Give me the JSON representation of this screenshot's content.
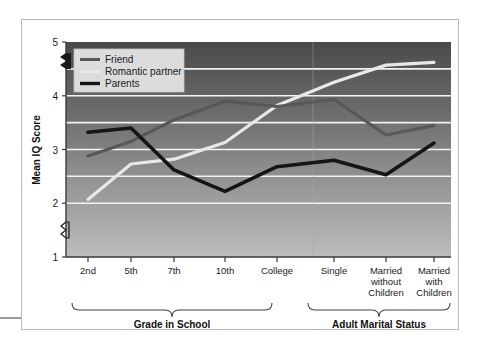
{
  "chart_data": {
    "type": "line",
    "title": "",
    "xlabel": "",
    "ylabel": "Mean IQ Score",
    "ylim": [
      1,
      5
    ],
    "yticks": [
      1,
      2,
      3,
      4,
      5
    ],
    "ytick_labels": [
      "1",
      "2",
      "3",
      "4",
      "5"
    ],
    "y_axis_break": true,
    "y_axis_break_between": [
      1,
      2
    ],
    "grid": true,
    "grid_lines_at": [
      2,
      2.5,
      3,
      3.5,
      4,
      4.5
    ],
    "legend_position": "top-left",
    "categories": [
      "2nd",
      "5th",
      "7th",
      "10th",
      "College",
      "Single",
      "Married without Children",
      "Married with Children"
    ],
    "series": [
      {
        "name": "Friend",
        "color": "#585858",
        "values": [
          2.88,
          3.15,
          3.55,
          3.9,
          3.8,
          3.93,
          3.27,
          3.45
        ]
      },
      {
        "name": "Romantic partner",
        "color": "#e8e8e8",
        "values": [
          2.07,
          2.73,
          2.82,
          3.13,
          3.82,
          4.25,
          4.57,
          4.62
        ]
      },
      {
        "name": "Parents",
        "color": "#151515",
        "values": [
          3.32,
          3.4,
          2.62,
          2.22,
          2.68,
          2.8,
          2.53,
          3.12
        ]
      }
    ],
    "group_brackets": [
      {
        "label": "Grade in School",
        "categories": [
          "2nd",
          "5th",
          "7th",
          "10th",
          "College"
        ]
      },
      {
        "label": "Adult Marital Status",
        "categories": [
          "Single",
          "Married without Children",
          "Married with Children"
        ]
      }
    ],
    "plot_background": {
      "gradient_from": "#4a4a4a",
      "gradient_to": "#b8b8b8",
      "gridline_color": "#f2f2f2"
    }
  },
  "legend": {
    "entries": [
      {
        "label": "Friend"
      },
      {
        "label": "Romantic partner"
      },
      {
        "label": "Parents"
      }
    ]
  },
  "axis": {
    "y_title": "Mean IQ Score",
    "y_labels": [
      "5",
      "4",
      "3",
      "2",
      "1"
    ]
  },
  "x_labels": [
    {
      "line1": "2nd",
      "line2": "",
      "line3": ""
    },
    {
      "line1": "5th",
      "line2": "",
      "line3": ""
    },
    {
      "line1": "7th",
      "line2": "",
      "line3": ""
    },
    {
      "line1": "10th",
      "line2": "",
      "line3": ""
    },
    {
      "line1": "College",
      "line2": "",
      "line3": ""
    },
    {
      "line1": "Single",
      "line2": "",
      "line3": ""
    },
    {
      "line1": "Married",
      "line2": "without",
      "line3": "Children"
    },
    {
      "line1": "Married",
      "line2": "with",
      "line3": "Children"
    }
  ],
  "brackets": {
    "left_label": "Grade in School",
    "right_label": "Adult Marital Status"
  }
}
